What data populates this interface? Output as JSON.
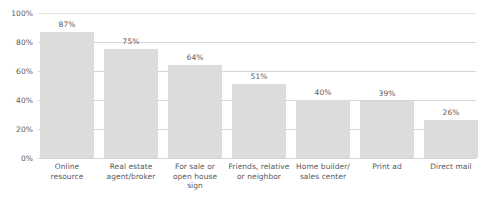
{
  "chart_data": {
    "type": "bar",
    "title": "",
    "subtitle": "",
    "xlabel": "",
    "ylabel": "",
    "ylim": [
      0,
      100
    ],
    "grid": true,
    "legend": false,
    "orientation": "vertical",
    "bar_color": "#dcdcdc",
    "text_color": "#58585a",
    "gridline_color": "#d5d5d8",
    "background_color": "#ffffff",
    "categories": [
      "Online resource",
      "Real estate agent/broker",
      "For sale or open house sign",
      "Friends, relative or neighbor",
      "Home builder/ sales center",
      "Print ad",
      "Direct mail"
    ],
    "category_lines": [
      [
        "Online",
        "resource"
      ],
      [
        "Real estate",
        "agent/broker"
      ],
      [
        "For sale or",
        "open house",
        "sign"
      ],
      [
        "Friends, relative",
        "or neighbor"
      ],
      [
        "Home builder/",
        "sales center"
      ],
      [
        "Print ad"
      ],
      [
        "Direct mail"
      ]
    ],
    "values": [
      87,
      75,
      64,
      51,
      40,
      39,
      26
    ],
    "value_labels": [
      "87%",
      "75%",
      "64%",
      "51%",
      "40%",
      "39%",
      "26%"
    ],
    "y_ticks": [
      0,
      20,
      40,
      60,
      80,
      100
    ],
    "y_tick_labels": [
      "0%",
      "20%",
      "40%",
      "60%",
      "80%",
      "100%"
    ]
  }
}
